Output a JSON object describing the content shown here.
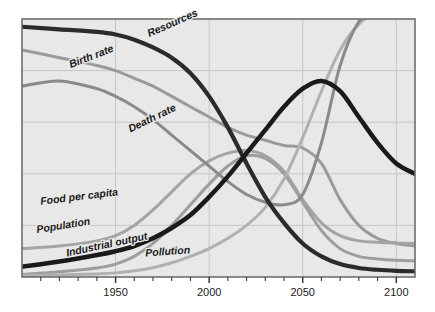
{
  "chart_data": {
    "type": "line",
    "title": "",
    "subtitle": "",
    "xlabel": "",
    "ylabel": "",
    "xlim": [
      1900,
      2110
    ],
    "ylim": [
      0,
      100
    ],
    "grid": true,
    "legend_position": "inline-curve-labels",
    "xticks_labeled": [
      "1950",
      "2000",
      "2050",
      "2100"
    ],
    "xtick_values": [
      1950,
      2000,
      2050,
      2100
    ],
    "xtick_minor_step": 10,
    "yticks_labeled": [],
    "gridline_y_values": [
      20,
      40,
      60,
      80
    ],
    "series": [
      {
        "name": "Resources",
        "label": "Resources",
        "color": "#2b2b2b",
        "width": 4.2,
        "x": [
          1900,
          1920,
          1940,
          1950,
          1960,
          1970,
          1980,
          1990,
          2000,
          2010,
          2020,
          2030,
          2040,
          2050,
          2060,
          2070,
          2080,
          2090,
          2100,
          2110
        ],
        "y": [
          97,
          96,
          95,
          94,
          92,
          89,
          85,
          79,
          70,
          58,
          44,
          31,
          21,
          13,
          8,
          5,
          3.5,
          2.8,
          2.4,
          2.2
        ]
      },
      {
        "name": "Birth rate",
        "label": "Birth rate",
        "color": "#9a9a9a",
        "width": 3.0,
        "x": [
          1900,
          1920,
          1940,
          1950,
          1960,
          1970,
          1980,
          1990,
          2000,
          2010,
          2020,
          2030,
          2040,
          2050,
          2060,
          2070,
          2080,
          2090,
          2100,
          2110
        ],
        "y": [
          88,
          85,
          82,
          80,
          77,
          74,
          70,
          66,
          62,
          58,
          55,
          53,
          51,
          50,
          44,
          30,
          20,
          15,
          13,
          12
        ]
      },
      {
        "name": "Death rate",
        "label": "Death rate",
        "color": "#8a8a8a",
        "width": 3.0,
        "x": [
          1900,
          1920,
          1940,
          1950,
          1960,
          1970,
          1980,
          1990,
          2000,
          2010,
          2020,
          2030,
          2040,
          2050,
          2060,
          2070,
          2080,
          2090,
          2100,
          2110
        ],
        "y": [
          74,
          76,
          73,
          70,
          66,
          61,
          55,
          49,
          43,
          37,
          32,
          29,
          28,
          32,
          52,
          82,
          99,
          104,
          106,
          107
        ]
      },
      {
        "name": "Food per capita",
        "label": "Food per capita",
        "color": "#a4a4a4",
        "width": 3.0,
        "x": [
          1900,
          1920,
          1940,
          1950,
          1960,
          1970,
          1980,
          1990,
          2000,
          2010,
          2020,
          2030,
          2040,
          2050,
          2060,
          2070,
          2080,
          2090,
          2100,
          2110
        ],
        "y": [
          11,
          12,
          14,
          16,
          20,
          26,
          33,
          40,
          45,
          48,
          49,
          47,
          41,
          30,
          21,
          16,
          14,
          13.5,
          13.2,
          13
        ]
      },
      {
        "name": "Population",
        "label": "Population",
        "color": "#1a1a1a",
        "width": 4.5,
        "x": [
          1900,
          1920,
          1940,
          1950,
          1960,
          1970,
          1980,
          1990,
          2000,
          2010,
          2020,
          2030,
          2040,
          2050,
          2060,
          2070,
          2080,
          2090,
          2100,
          2110
        ],
        "y": [
          4,
          6,
          8.5,
          10,
          12,
          15,
          19,
          24,
          31,
          39,
          48,
          57,
          66,
          73,
          76,
          72,
          62,
          52,
          44,
          40
        ]
      },
      {
        "name": "Industrial output",
        "label": "Industrial output",
        "color": "#9e9e9e",
        "width": 3.0,
        "x": [
          1900,
          1920,
          1940,
          1950,
          1960,
          1970,
          1980,
          1990,
          2000,
          2010,
          2020,
          2030,
          2040,
          2050,
          2060,
          2070,
          2080,
          2090,
          2100,
          2110
        ],
        "y": [
          1,
          2,
          3.5,
          5,
          8,
          13,
          20,
          28,
          36,
          43,
          47,
          46,
          40,
          29,
          18,
          11,
          8,
          7,
          6.5,
          6.3
        ]
      },
      {
        "name": "Pollution",
        "label": "Pollution",
        "color": "#b0b0b0",
        "width": 3.0,
        "x": [
          1900,
          1920,
          1940,
          1950,
          1960,
          1970,
          1980,
          1990,
          2000,
          2010,
          2020,
          2030,
          2040,
          2050,
          2060,
          2070,
          2080,
          2090,
          2100,
          2110
        ],
        "y": [
          0.5,
          0.8,
          1.2,
          1.6,
          2.4,
          3.6,
          5.5,
          8,
          11,
          15,
          20,
          27,
          38,
          54,
          72,
          88,
          98,
          103,
          106,
          108
        ]
      }
    ],
    "annotations": [
      {
        "text": "Resources",
        "x": 1968,
        "y": 93,
        "rotation": -24
      },
      {
        "text": "Birth rate",
        "x": 1926,
        "y": 81,
        "rotation": -21
      },
      {
        "text": "Death rate",
        "x": 1958,
        "y": 56,
        "rotation": -26
      },
      {
        "text": "Food per capita",
        "x": 1910,
        "y": 28,
        "rotation": -7
      },
      {
        "text": "Population",
        "x": 1908,
        "y": 17,
        "rotation": -9
      },
      {
        "text": "Industrial output",
        "x": 1924,
        "y": 8,
        "rotation": -12
      },
      {
        "text": "Pollution",
        "x": 1966,
        "y": 8,
        "rotation": -4
      }
    ]
  },
  "axis": {
    "x_tick_labels": [
      "1950",
      "2000",
      "2050",
      "2100"
    ]
  },
  "style": {
    "plot_background": "#e8e8e8",
    "frame_color": "#6e6e6e",
    "grid_color": "#c6c6c6",
    "page_background": "#ffffff"
  }
}
